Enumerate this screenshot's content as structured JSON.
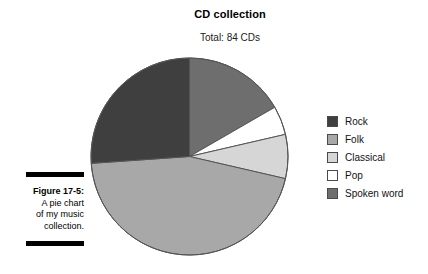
{
  "chart_data": {
    "type": "pie",
    "title": "CD collection",
    "subtitle": "Total: 84 CDs",
    "total": 84,
    "total_label": "Total: 84 CDs",
    "xlabel": "",
    "ylabel": "",
    "grid": false,
    "legend_position": "right",
    "start_angle_deg": 0,
    "direction": "clockwise",
    "categories": [
      "Rock",
      "Folk",
      "Classical",
      "Pop",
      "Spoken word"
    ],
    "values": [
      22,
      38,
      6,
      4,
      14
    ],
    "colors": [
      "#3f3f3f",
      "#a8a8a8",
      "#d6d6d6",
      "#ffffff",
      "#6e6e6e"
    ],
    "slices": [
      {
        "label": "Spoken word",
        "value": 14,
        "color": "#6e6e6e",
        "start_deg": 0,
        "end_deg": 60,
        "percent": 16.7
      },
      {
        "label": "Pop",
        "value": 4,
        "color": "#ffffff",
        "start_deg": 60,
        "end_deg": 77,
        "percent": 4.8
      },
      {
        "label": "Classical",
        "value": 6,
        "color": "#d6d6d6",
        "start_deg": 77,
        "end_deg": 103,
        "percent": 7.1
      },
      {
        "label": "Folk",
        "value": 38,
        "color": "#a8a8a8",
        "start_deg": 103,
        "end_deg": 266,
        "percent": 45.2
      },
      {
        "label": "Rock",
        "value": 22,
        "color": "#3f3f3f",
        "start_deg": 266,
        "end_deg": 360,
        "percent": 26.2
      }
    ],
    "outline_color": "#555555"
  },
  "legend": {
    "items": [
      {
        "label": "Rock",
        "color": "#3f3f3f"
      },
      {
        "label": "Folk",
        "color": "#a8a8a8"
      },
      {
        "label": "Classical",
        "color": "#d6d6d6"
      },
      {
        "label": "Pop",
        "color": "#ffffff"
      },
      {
        "label": "Spoken word",
        "color": "#6e6e6e"
      }
    ]
  },
  "caption": {
    "figure_number": "Figure 17-5:",
    "line1": "A pie chart",
    "line2": "of my music",
    "line3": "collection."
  }
}
